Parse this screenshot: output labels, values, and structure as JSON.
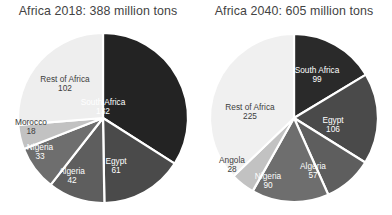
{
  "chart_data": [
    {
      "type": "pie",
      "title": "Africa 2018: 388 million tons",
      "total": 388,
      "unit": "million tons",
      "start_angle_deg": 0,
      "direction": "clockwise",
      "legend": "none (direct slice labels)",
      "categories": [
        "South Africa",
        "Egypt",
        "Algeria",
        "Nigeria",
        "Morocco",
        "Rest of Africa"
      ],
      "values": [
        132,
        61,
        42,
        33,
        18,
        102
      ],
      "colors": [
        "#232323",
        "#4a4a4a",
        "#5e5e5e",
        "#6e6e6e",
        "#c2c2c2",
        "#eeeeee"
      ],
      "slices": [
        {
          "name": "South Africa",
          "value": 132,
          "value_text": "132",
          "color": "#232323",
          "text_color": "light",
          "lx": 103,
          "ly": 107
        },
        {
          "name": "Egypt",
          "value": 61,
          "value_text": "61",
          "color": "#4a4a4a",
          "text_color": "light",
          "lx": 116,
          "ly": 166
        },
        {
          "name": "Algeria",
          "value": 42,
          "value_text": "42",
          "color": "#5e5e5e",
          "text_color": "light",
          "lx": 72,
          "ly": 176
        },
        {
          "name": "Nigeria",
          "value": 33,
          "value_text": "33",
          "color": "#6e6e6e",
          "text_color": "light",
          "lx": 40,
          "ly": 152
        },
        {
          "name": "Morocco",
          "value": 18,
          "value_text": "18",
          "color": "#c2c2c2",
          "text_color": "dark",
          "lx": 31,
          "ly": 127
        },
        {
          "name": "Rest of Africa",
          "value": 102,
          "value_text": "102",
          "color": "#eeeeee",
          "text_color": "dark",
          "lx": 65,
          "ly": 84
        }
      ]
    },
    {
      "type": "pie",
      "title": "Africa 2040: 605 million tons",
      "total": 605,
      "unit": "million tons",
      "start_angle_deg": 0,
      "direction": "clockwise",
      "legend": "none (direct slice labels)",
      "categories": [
        "South Africa",
        "Egypt",
        "Algeria",
        "Nigeria",
        "Angola",
        "Rest of Africa"
      ],
      "values": [
        99,
        106,
        57,
        90,
        28,
        225
      ],
      "colors": [
        "#2a2a2a",
        "#4a4a4a",
        "#5e5e5e",
        "#6e6e6e",
        "#c2c2c2",
        "#f0f0f0"
      ],
      "slices": [
        {
          "name": "South Africa",
          "value": 99,
          "value_text": "99",
          "color": "#2a2a2a",
          "text_color": "light",
          "lx": 121,
          "ly": 75
        },
        {
          "name": "Egypt",
          "value": 106,
          "value_text": "106",
          "color": "#4a4a4a",
          "text_color": "light",
          "lx": 137,
          "ly": 125
        },
        {
          "name": "Algeria",
          "value": 57,
          "value_text": "57",
          "color": "#5e5e5e",
          "text_color": "light",
          "lx": 117,
          "ly": 171
        },
        {
          "name": "Nigeria",
          "value": 90,
          "value_text": "90",
          "color": "#6e6e6e",
          "text_color": "light",
          "lx": 72,
          "ly": 181
        },
        {
          "name": "Angola",
          "value": 28,
          "value_text": "28",
          "color": "#c2c2c2",
          "text_color": "dark",
          "lx": 36,
          "ly": 165
        },
        {
          "name": "Rest of Africa",
          "value": 225,
          "value_text": "225",
          "color": "#f0f0f0",
          "text_color": "dark",
          "lx": 54,
          "ly": 112
        }
      ]
    }
  ],
  "geometry": {
    "left_pie": {
      "cx": 103,
      "cy": 118,
      "r": 85
    },
    "right_pie": {
      "cx": 98,
      "cy": 118,
      "r": 84
    },
    "separator_color": "#ffffff",
    "separator_width": 2.2
  },
  "page": {
    "background": "#ffffff"
  }
}
